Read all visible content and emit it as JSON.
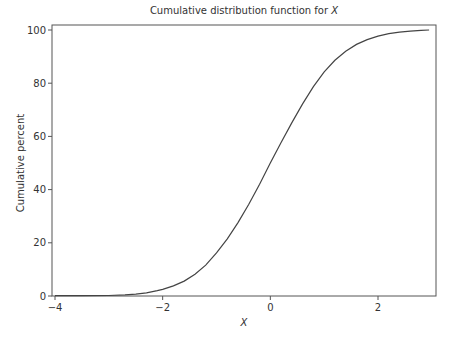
{
  "chart_data": {
    "type": "line",
    "title": "Cumulative distribution function for ",
    "title_var": "X",
    "xlabel": "X",
    "ylabel": "Cumulative percent",
    "xlim": [
      -4.05,
      3.08
    ],
    "ylim": [
      0,
      100
    ],
    "xticks": [
      -4,
      -2,
      0,
      2
    ],
    "xtick_labels": [
      "−4",
      "−2",
      "0",
      "2"
    ],
    "yticks": [
      0,
      20,
      40,
      60,
      80,
      100
    ],
    "ytick_labels": [
      "0",
      "20",
      "40",
      "60",
      "80",
      "100"
    ],
    "grid": false,
    "legend": null,
    "series": [
      {
        "name": "Empirical CDF of X",
        "x": [
          -4.0,
          -3.5,
          -3.0,
          -2.7,
          -2.5,
          -2.3,
          -2.1,
          -2.0,
          -1.8,
          -1.6,
          -1.4,
          -1.2,
          -1.0,
          -0.8,
          -0.6,
          -0.4,
          -0.2,
          0.0,
          0.2,
          0.4,
          0.6,
          0.8,
          1.0,
          1.2,
          1.4,
          1.6,
          1.8,
          2.0,
          2.2,
          2.4,
          2.6,
          2.8,
          2.95
        ],
        "values": [
          0.1,
          0.1,
          0.2,
          0.4,
          0.7,
          1.2,
          2.0,
          2.5,
          3.8,
          5.6,
          8.2,
          11.6,
          16.2,
          21.5,
          27.6,
          34.5,
          42.0,
          50.0,
          57.7,
          65.2,
          72.2,
          78.7,
          84.3,
          88.6,
          92.0,
          94.6,
          96.4,
          97.7,
          98.6,
          99.2,
          99.6,
          99.9,
          100.0
        ]
      }
    ],
    "colors": {
      "line": "#444444",
      "frame": "#555555"
    }
  }
}
